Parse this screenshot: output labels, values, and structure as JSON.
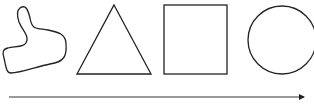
{
  "diagram": {
    "shapes": [
      {
        "name": "irregular-blob",
        "type": "freeform"
      },
      {
        "name": "triangle",
        "type": "triangle"
      },
      {
        "name": "square",
        "type": "square"
      },
      {
        "name": "circle",
        "type": "circle"
      }
    ],
    "arrow": {
      "direction": "right"
    },
    "colors": {
      "stroke": "#222222",
      "background": "#ffffff"
    }
  }
}
